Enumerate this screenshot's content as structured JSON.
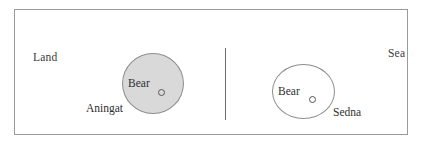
{
  "figure": {
    "regions": [
      {
        "id": "land",
        "label": "Land"
      },
      {
        "id": "sea",
        "label": "Sea"
      }
    ],
    "divider": {
      "orientation": "vertical"
    },
    "zones": [
      {
        "id": "aningat",
        "name": "Aningat",
        "occupant": "Bear",
        "fill": "#d9d9d9",
        "stroke": "#8e8e8e",
        "side": "land"
      },
      {
        "id": "sedna",
        "name": "Sedna",
        "occupant": "Bear",
        "fill": "#ffffff",
        "stroke": "#8e8e8e",
        "side": "sea"
      }
    ],
    "frame": {
      "stroke": "#9a9a9a"
    },
    "text_color": "#2e2e2e"
  }
}
